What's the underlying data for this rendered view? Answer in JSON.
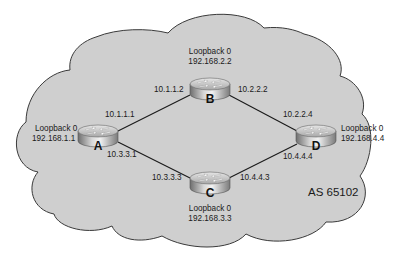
{
  "diagram": {
    "autonomous_system": "AS 65102",
    "colors": {
      "cloud_fill": "#cfcfcf",
      "cloud_stroke": "#3a3a3a",
      "link": "#1a1a1a",
      "background": "#ffffff"
    },
    "routers": [
      {
        "id": "A",
        "name": "A",
        "loopback_label": "Loopback 0",
        "loopback_ip": "192.168.1.1"
      },
      {
        "id": "B",
        "name": "B",
        "loopback_label": "Loopback 0",
        "loopback_ip": "192.168.2.2"
      },
      {
        "id": "C",
        "name": "C",
        "loopback_label": "Loopback 0",
        "loopback_ip": "192.168.3.3"
      },
      {
        "id": "D",
        "name": "D",
        "loopback_label": "Loopback 0",
        "loopback_ip": "192.168.4.4"
      }
    ],
    "links": [
      {
        "from": "A",
        "to": "B",
        "from_ip": "10.1.1.1",
        "to_ip": "10.1.1.2"
      },
      {
        "from": "B",
        "to": "D",
        "from_ip": "10.2.2.2",
        "to_ip": "10.2.2.4"
      },
      {
        "from": "A",
        "to": "C",
        "from_ip": "10.3.3.1",
        "to_ip": "10.3.3.3"
      },
      {
        "from": "C",
        "to": "D",
        "from_ip": "10.4.4.3",
        "to_ip": "10.4.4.4"
      }
    ]
  }
}
